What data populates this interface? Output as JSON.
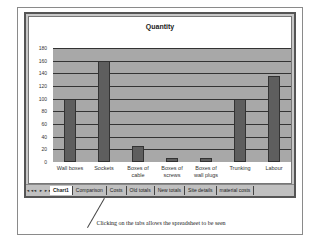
{
  "chart_data": {
    "type": "bar",
    "title": "Quantity",
    "categories": [
      "Wall boxes",
      "Sockets",
      "Boxes of cable",
      "Boxes of screws",
      "Boxes of wall plugs",
      "Trunking",
      "Labour"
    ],
    "values": [
      100,
      160,
      26,
      7,
      7,
      100,
      136
    ],
    "xlabel": "",
    "ylabel": "",
    "ylim": [
      0,
      180
    ],
    "yticks": [
      0,
      20,
      40,
      60,
      80,
      100,
      120,
      140,
      160,
      180
    ],
    "grid": true,
    "legend": null,
    "colors": {
      "bar": "#5e5e5e",
      "plot_bg": "#a8a8a8",
      "gridline": "#333333"
    }
  },
  "chart": {
    "title": "Quantity",
    "yticks": [
      "0",
      "20",
      "40",
      "60",
      "80",
      "100",
      "120",
      "140",
      "160",
      "180"
    ],
    "xlabels": [
      {
        "line1": "Wall boxes",
        "line2": ""
      },
      {
        "line1": "Sockets",
        "line2": ""
      },
      {
        "line1": "Boxes of",
        "line2": "cable"
      },
      {
        "line1": "Boxes of",
        "line2": "screws"
      },
      {
        "line1": "Boxes of",
        "line2": "wall plugs"
      },
      {
        "line1": "Trunking",
        "line2": ""
      },
      {
        "line1": "Labour",
        "line2": ""
      }
    ]
  },
  "tabs": {
    "nav": [
      "◄◄",
      "◄",
      "►",
      "►►"
    ],
    "items": [
      "Chart1",
      "Comparison",
      "Costs",
      "Old totals",
      "New totals",
      "Site details",
      "material costs"
    ],
    "active": "Chart1"
  },
  "caption": "Clicking on the tabs allows the spreadsheet to be seen"
}
